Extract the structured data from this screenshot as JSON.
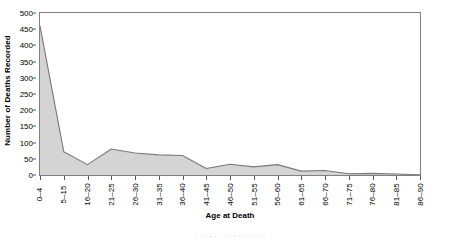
{
  "chart_data": {
    "type": "area",
    "title": "",
    "xlabel": "Age at Death",
    "ylabel": "Number of Deaths Recorded",
    "categories": [
      "0–4",
      "5–15",
      "16–20",
      "21–25",
      "26–30",
      "31–35",
      "36–40",
      "41–45",
      "46–50",
      "51–55",
      "56–60",
      "61–65",
      "66–70",
      "71–75",
      "76–80",
      "81–85",
      "86–90"
    ],
    "values": [
      460,
      72,
      32,
      80,
      68,
      62,
      60,
      20,
      33,
      25,
      32,
      12,
      14,
      4,
      5,
      3,
      1
    ],
    "ylim": [
      0,
      500
    ],
    "ytick_step": 50,
    "yticks": [
      0,
      50,
      100,
      150,
      200,
      250,
      300,
      350,
      400,
      450,
      500
    ],
    "ytick_labels": [
      "0",
      "50",
      "100",
      "150",
      "200",
      "250",
      "300",
      "350",
      "400",
      "450",
      "500"
    ],
    "grid": false,
    "legend": false,
    "legend_position": "none",
    "series_fill_color": "#d4d4d4",
    "series_line_color": "#7a7a7a",
    "axis_color": "#808080"
  },
  "caption": {
    "sliver_text": "· · · · · · · · · · · · · · ·"
  }
}
